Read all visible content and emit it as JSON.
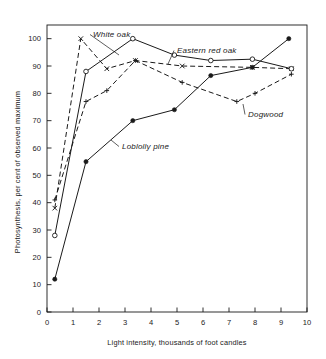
{
  "chart_data": {
    "type": "line",
    "title": "",
    "xlabel": "Light intensity, thousands of foot candles",
    "ylabel": "Photosynthesis, per cent of observed maximum",
    "xlim": [
      0,
      10
    ],
    "ylim": [
      0,
      105
    ],
    "xticks": [
      0,
      1,
      2,
      3,
      4,
      5,
      6,
      7,
      8,
      9,
      10
    ],
    "yticks": [
      0,
      10,
      20,
      30,
      40,
      50,
      60,
      70,
      80,
      90,
      100
    ],
    "xtick_labels": [
      "0",
      "1",
      "2",
      "3",
      "4",
      "5",
      "6",
      "7",
      "8",
      "9",
      "10"
    ],
    "ytick_labels": [
      "0",
      "10",
      "20",
      "30",
      "40",
      "50",
      "60",
      "70",
      "80",
      "90",
      "100"
    ],
    "grid": false,
    "legend": "inline-annotations",
    "series": [
      {
        "name": "White oak",
        "marker": "x-cross",
        "line_style": "dashed",
        "color": "#1a1a1a",
        "points": [
          {
            "x": 0.3,
            "y": 38
          },
          {
            "x": 1.3,
            "y": 100
          },
          {
            "x": 2.3,
            "y": 89
          },
          {
            "x": 3.4,
            "y": 92
          },
          {
            "x": 5.2,
            "y": 90
          },
          {
            "x": 7.9,
            "y": 89.5
          },
          {
            "x": 9.4,
            "y": 89
          }
        ]
      },
      {
        "name": "Eastern red oak",
        "marker": "open-circle",
        "line_style": "solid",
        "color": "#1a1a1a",
        "points": [
          {
            "x": 0.3,
            "y": 28
          },
          {
            "x": 1.5,
            "y": 88
          },
          {
            "x": 3.3,
            "y": 100
          },
          {
            "x": 4.9,
            "y": 94
          },
          {
            "x": 6.3,
            "y": 92
          },
          {
            "x": 7.9,
            "y": 92.5
          },
          {
            "x": 9.4,
            "y": 89
          }
        ]
      },
      {
        "name": "Dogwood",
        "marker": "plus",
        "line_style": "dashed",
        "color": "#1a1a1a",
        "points": [
          {
            "x": 0.3,
            "y": 41
          },
          {
            "x": 1.5,
            "y": 77
          },
          {
            "x": 2.3,
            "y": 81
          },
          {
            "x": 3.4,
            "y": 92
          },
          {
            "x": 5.2,
            "y": 84
          },
          {
            "x": 7.3,
            "y": 77
          },
          {
            "x": 8.0,
            "y": 80
          },
          {
            "x": 9.4,
            "y": 87
          }
        ]
      },
      {
        "name": "Loblolly pine",
        "marker": "filled-circle",
        "line_style": "solid",
        "color": "#1a1a1a",
        "points": [
          {
            "x": 0.3,
            "y": 12
          },
          {
            "x": 1.5,
            "y": 55
          },
          {
            "x": 3.3,
            "y": 70
          },
          {
            "x": 4.9,
            "y": 74
          },
          {
            "x": 6.3,
            "y": 86.5
          },
          {
            "x": 7.9,
            "y": 89.5
          },
          {
            "x": 9.3,
            "y": 100
          }
        ]
      }
    ],
    "annotations": [
      {
        "label": "White oak",
        "text_x": 93,
        "text_y": 37,
        "leader_to_x": 119,
        "leader_to_y": 55
      },
      {
        "label": "Eastern red oak",
        "text_x": 177,
        "text_y": 53,
        "leader_to_x": 168,
        "leader_to_y": 64
      },
      {
        "label": "Dogwood",
        "text_x": 248,
        "text_y": 117,
        "leader_to_x": 243,
        "leader_to_y": 104
      },
      {
        "label": "Loblolly pine",
        "text_x": 122,
        "text_y": 149,
        "leader_to_x": 111,
        "leader_to_y": 140
      }
    ]
  }
}
